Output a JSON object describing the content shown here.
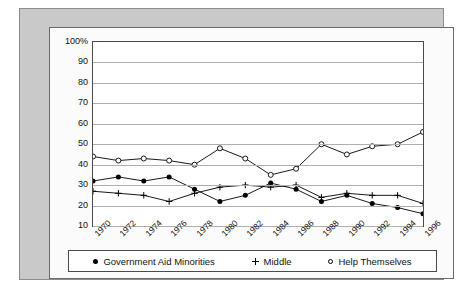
{
  "chart_data": {
    "type": "line",
    "title": "",
    "xlabel": "",
    "ylabel": "",
    "ylim": [
      10,
      100
    ],
    "grid": true,
    "legend_position": "bottom",
    "x": [
      1970,
      1971,
      1972,
      1973,
      1974,
      1975,
      1976,
      1977,
      1978,
      1979,
      1980,
      1981,
      1982,
      1983,
      1984,
      1985,
      1986,
      1987,
      1988,
      1989,
      1990,
      1991,
      1992,
      1993,
      1994,
      1995,
      1996
    ],
    "xtick_labels": [
      "1970",
      "1972",
      "1974",
      "1976",
      "1978",
      "1980",
      "1982",
      "1984",
      "1986",
      "1988",
      "1990",
      "1992",
      "1994",
      "1996"
    ],
    "ytick_labels": [
      "100%",
      "90",
      "80",
      "70",
      "60",
      "50",
      "40",
      "30",
      "20",
      "10"
    ],
    "ytick_values": [
      100,
      90,
      80,
      70,
      60,
      50,
      40,
      30,
      20,
      10
    ],
    "series": [
      {
        "name": "Government Aid Minorities",
        "marker": "filled-circle",
        "x": [
          1970,
          1972,
          1974,
          1976,
          1978,
          1980,
          1982,
          1984,
          1986,
          1988,
          1990,
          1992,
          1994,
          1996
        ],
        "values": [
          32,
          34,
          32,
          34,
          28,
          22,
          25,
          31,
          28,
          22,
          25,
          21,
          19,
          16
        ]
      },
      {
        "name": "Middle",
        "marker": "plus",
        "x": [
          1970,
          1972,
          1974,
          1976,
          1978,
          1980,
          1982,
          1984,
          1986,
          1988,
          1990,
          1992,
          1994,
          1996
        ],
        "values": [
          27,
          26,
          25,
          22,
          26,
          29,
          30,
          29,
          30,
          24,
          26,
          25,
          25,
          21
        ]
      },
      {
        "name": "Help Themselves",
        "marker": "open-circle",
        "x": [
          1970,
          1972,
          1974,
          1976,
          1978,
          1980,
          1982,
          1984,
          1986,
          1988,
          1990,
          1992,
          1994,
          1996
        ],
        "values": [
          44,
          42,
          43,
          42,
          40,
          48,
          43,
          35,
          38,
          50,
          45,
          49,
          50,
          56
        ]
      }
    ]
  },
  "legend": {
    "entries": [
      {
        "label": "Government Aid Minorities",
        "marker": "filled-circle"
      },
      {
        "label": "Middle",
        "marker": "plus"
      },
      {
        "label": "Help Themselves",
        "marker": "open-circle"
      }
    ]
  },
  "colors": {
    "series_line": "#000000",
    "gridline": "#b0b0b0",
    "axis": "#4a4a4a",
    "figure_background": "#c9c9c9",
    "plot_background": "#ffffff"
  }
}
